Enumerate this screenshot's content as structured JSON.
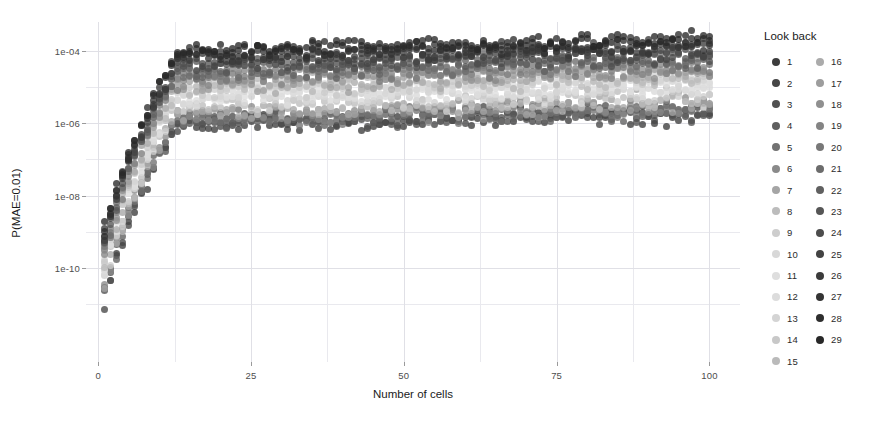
{
  "chart_data": {
    "type": "scatter",
    "title": "",
    "xlabel": "Number of cells",
    "ylabel": "P(MAE=0.01)",
    "xlim": [
      -2,
      105
    ],
    "ylim_log10": [
      -12.6,
      -3.2
    ],
    "yscale": "log",
    "grid": true,
    "legend": {
      "title": "Look back",
      "position": "right",
      "columns": 2,
      "entries": [
        {
          "label": "1",
          "color": "#3c3c3c"
        },
        {
          "label": "2",
          "color": "#464646"
        },
        {
          "label": "3",
          "color": "#515151"
        },
        {
          "label": "4",
          "color": "#5f5f5f"
        },
        {
          "label": "5",
          "color": "#727272"
        },
        {
          "label": "6",
          "color": "#8a8a8a"
        },
        {
          "label": "7",
          "color": "#a5a5a5"
        },
        {
          "label": "8",
          "color": "#bcbcbc"
        },
        {
          "label": "9",
          "color": "#cdcdcd"
        },
        {
          "label": "10",
          "color": "#d8d8d8"
        },
        {
          "label": "11",
          "color": "#dedede"
        },
        {
          "label": "12",
          "color": "#dcdcdc"
        },
        {
          "label": "13",
          "color": "#d4d4d4"
        },
        {
          "label": "14",
          "color": "#c8c8c8"
        },
        {
          "label": "15",
          "color": "#bababa"
        },
        {
          "label": "16",
          "color": "#ababab"
        },
        {
          "label": "17",
          "color": "#9d9d9d"
        },
        {
          "label": "18",
          "color": "#909090"
        },
        {
          "label": "19",
          "color": "#848484"
        },
        {
          "label": "20",
          "color": "#787878"
        },
        {
          "label": "21",
          "color": "#6c6c6c"
        },
        {
          "label": "22",
          "color": "#606060"
        },
        {
          "label": "23",
          "color": "#565656"
        },
        {
          "label": "24",
          "color": "#4c4c4c"
        },
        {
          "label": "25",
          "color": "#434343"
        },
        {
          "label": "26",
          "color": "#3b3b3b"
        },
        {
          "label": "27",
          "color": "#343434"
        },
        {
          "label": "28",
          "color": "#2e2e2e"
        },
        {
          "label": "29",
          "color": "#282828"
        }
      ]
    },
    "xticks": [
      {
        "value": 0,
        "label": "0"
      },
      {
        "value": 25,
        "label": "25"
      },
      {
        "value": 50,
        "label": "50"
      },
      {
        "value": 75,
        "label": "75"
      },
      {
        "value": 100,
        "label": "100"
      }
    ],
    "yticks": [
      {
        "log10": -4,
        "label": "1e-04"
      },
      {
        "log10": -6,
        "label": "1e-06"
      },
      {
        "log10": -8,
        "label": "1e-08"
      },
      {
        "log10": -10,
        "label": "1e-10"
      }
    ],
    "x_minor_gridlines": [
      12.5,
      37.5,
      62.5,
      87.5
    ],
    "y_minor_gridlines_log10": [
      -5,
      -7,
      -9,
      -11
    ],
    "series": [
      {
        "name": "1",
        "color": "#3c3c3c",
        "plateau_log10": -6.05,
        "start_log10": -12.1,
        "rise_cells": 13,
        "spread": 0.3
      },
      {
        "name": "2",
        "color": "#464646",
        "plateau_log10": -6.0,
        "start_log10": -12.0,
        "rise_cells": 13,
        "spread": 0.3
      },
      {
        "name": "3",
        "color": "#515151",
        "plateau_log10": -5.95,
        "start_log10": -11.9,
        "rise_cells": 13,
        "spread": 0.3
      },
      {
        "name": "4",
        "color": "#5f5f5f",
        "plateau_log10": -5.92,
        "start_log10": -11.8,
        "rise_cells": 13,
        "spread": 0.3
      },
      {
        "name": "5",
        "color": "#727272",
        "plateau_log10": -5.88,
        "start_log10": -11.8,
        "rise_cells": 13,
        "spread": 0.3
      },
      {
        "name": "6",
        "color": "#8a8a8a",
        "plateau_log10": -5.8,
        "start_log10": -11.7,
        "rise_cells": 13,
        "spread": 0.32
      },
      {
        "name": "7",
        "color": "#a5a5a5",
        "plateau_log10": -5.7,
        "start_log10": -11.6,
        "rise_cells": 13,
        "spread": 0.32
      },
      {
        "name": "8",
        "color": "#bcbcbc",
        "plateau_log10": -5.58,
        "start_log10": -11.5,
        "rise_cells": 13,
        "spread": 0.33
      },
      {
        "name": "9",
        "color": "#cdcdcd",
        "plateau_log10": -5.45,
        "start_log10": -11.4,
        "rise_cells": 13,
        "spread": 0.34
      },
      {
        "name": "10",
        "color": "#d8d8d8",
        "plateau_log10": -5.32,
        "start_log10": -11.3,
        "rise_cells": 13,
        "spread": 0.35
      },
      {
        "name": "11",
        "color": "#dedede",
        "plateau_log10": -5.22,
        "start_log10": -11.2,
        "rise_cells": 13,
        "spread": 0.35
      },
      {
        "name": "12",
        "color": "#dcdcdc",
        "plateau_log10": -5.15,
        "start_log10": -11.2,
        "rise_cells": 13,
        "spread": 0.35
      },
      {
        "name": "13",
        "color": "#d4d4d4",
        "plateau_log10": -5.08,
        "start_log10": -11.1,
        "rise_cells": 13,
        "spread": 0.35
      },
      {
        "name": "14",
        "color": "#c8c8c8",
        "plateau_log10": -5.02,
        "start_log10": -11.1,
        "rise_cells": 13,
        "spread": 0.35
      },
      {
        "name": "15",
        "color": "#bababa",
        "plateau_log10": -4.96,
        "start_log10": -11.0,
        "rise_cells": 13,
        "spread": 0.35
      },
      {
        "name": "16",
        "color": "#ababab",
        "plateau_log10": -4.9,
        "start_log10": -11.0,
        "rise_cells": 13,
        "spread": 0.35
      },
      {
        "name": "17",
        "color": "#9d9d9d",
        "plateau_log10": -4.84,
        "start_log10": -10.9,
        "rise_cells": 13,
        "spread": 0.35
      },
      {
        "name": "18",
        "color": "#909090",
        "plateau_log10": -4.78,
        "start_log10": -10.9,
        "rise_cells": 13,
        "spread": 0.35
      },
      {
        "name": "19",
        "color": "#848484",
        "plateau_log10": -4.72,
        "start_log10": -10.8,
        "rise_cells": 13,
        "spread": 0.35
      },
      {
        "name": "20",
        "color": "#787878",
        "plateau_log10": -4.66,
        "start_log10": -10.8,
        "rise_cells": 13,
        "spread": 0.34
      },
      {
        "name": "21",
        "color": "#6c6c6c",
        "plateau_log10": -4.58,
        "start_log10": -10.7,
        "rise_cells": 13,
        "spread": 0.34
      },
      {
        "name": "22",
        "color": "#606060",
        "plateau_log10": -4.5,
        "start_log10": -10.7,
        "rise_cells": 13,
        "spread": 0.33
      },
      {
        "name": "23",
        "color": "#565656",
        "plateau_log10": -4.42,
        "start_log10": -10.6,
        "rise_cells": 13,
        "spread": 0.32
      },
      {
        "name": "24",
        "color": "#4c4c4c",
        "plateau_log10": -4.34,
        "start_log10": -10.6,
        "rise_cells": 13,
        "spread": 0.31
      },
      {
        "name": "25",
        "color": "#434343",
        "plateau_log10": -4.26,
        "start_log10": -10.5,
        "rise_cells": 13,
        "spread": 0.3
      },
      {
        "name": "26",
        "color": "#3b3b3b",
        "plateau_log10": -4.18,
        "start_log10": -10.5,
        "rise_cells": 13,
        "spread": 0.29
      },
      {
        "name": "27",
        "color": "#343434",
        "plateau_log10": -4.1,
        "start_log10": -10.4,
        "rise_cells": 13,
        "spread": 0.28
      },
      {
        "name": "28",
        "color": "#2e2e2e",
        "plateau_log10": -4.03,
        "start_log10": -10.4,
        "rise_cells": 13,
        "spread": 0.27
      },
      {
        "name": "29",
        "color": "#282828",
        "plateau_log10": -3.96,
        "start_log10": -10.3,
        "rise_cells": 13,
        "spread": 0.26
      }
    ]
  }
}
